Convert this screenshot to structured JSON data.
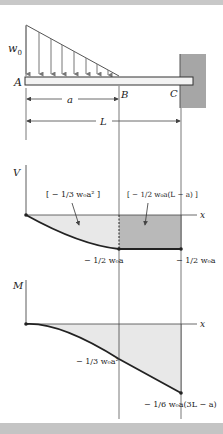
{
  "figure": {
    "beam": {
      "load_label": "w",
      "load_sub": "0",
      "point_A": "A",
      "point_B": "B",
      "point_C": "C",
      "dim_a": "a",
      "dim_L": "L"
    },
    "shear_diagram": {
      "axis_label": "V",
      "x_label": "x",
      "area_left": "[ − 1/3 w₀a² ]",
      "area_right": "[ − 1/2 w₀a(L − a) ]",
      "value_B": "− 1/2 w₀a",
      "value_C": "− 1/2 w₀a"
    },
    "moment_diagram": {
      "axis_label": "M",
      "x_label": "x",
      "value_B": "− 1/3 w₀a²",
      "value_C": "− 1/6 w₀a(3L − a)"
    },
    "colors": {
      "light_fill": "#e8e8e8",
      "dark_fill": "#b9b9b9",
      "wall": "#a6a6a6",
      "line": "#222222",
      "load_arrows": "#777777"
    }
  }
}
